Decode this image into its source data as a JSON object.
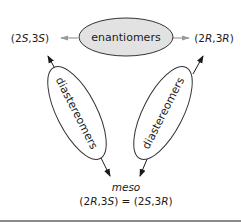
{
  "diagram": {
    "top_relation": {
      "label": "enantiomers",
      "fill": "#e2e2e2"
    },
    "left_relation": {
      "label": "diastereomers"
    },
    "right_relation": {
      "label": "diastereomers"
    },
    "nodes": {
      "left": {
        "pre": "(2",
        "c1": "S",
        "mid": ",3",
        "c2": "S",
        "post": ")"
      },
      "right": {
        "pre": "(2",
        "c1": "R",
        "mid": ",3",
        "c2": "R",
        "post": ")"
      },
      "bottom": {
        "title": "meso",
        "eq_a_pre": "(2",
        "eq_a_c1": "R",
        "eq_a_mid": ",3",
        "eq_a_c2": "S",
        "eq_a_post": ")",
        "equals": " = ",
        "eq_b_pre": "(2",
        "eq_b_c1": "S",
        "eq_b_mid": ",3",
        "eq_b_c2": "R",
        "eq_b_post": ")"
      }
    },
    "colors": {
      "stroke": "#333333",
      "arrow_grey": "#9a9a9a",
      "rule": "#8a8a8a"
    }
  }
}
